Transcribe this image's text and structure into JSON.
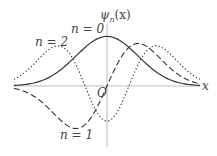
{
  "chart_data": {
    "type": "line",
    "title": "",
    "xlabel": "x",
    "ylabel": "ψn(x)",
    "origin_label": "O",
    "xlim": [
      -3.0,
      3.0
    ],
    "ylim": [
      -0.9,
      1.0
    ],
    "grid": false,
    "legend": "inline labels",
    "series": [
      {
        "name": "n=0",
        "style": "solid",
        "label_text": "n=0",
        "formula": "pi^-0.25 * exp(-x^2/2)"
      },
      {
        "name": "n=1",
        "style": "dashed",
        "label_text": "n=1",
        "formula": "sqrt(2) * pi^-0.25 * x * exp(-x^2/2)"
      },
      {
        "name": "n=2",
        "style": "dotted",
        "label_text": "n=2",
        "formula": "(2x^2-1)/sqrt(2) * pi^-0.25 * exp(-x^2/2)"
      }
    ],
    "x": [
      -3,
      -2.5,
      -2,
      -1.5,
      -1,
      -0.5,
      0,
      0.5,
      1,
      1.5,
      2,
      2.5,
      3
    ],
    "values": {
      "n=0": [
        0.008,
        0.033,
        0.102,
        0.245,
        0.456,
        0.663,
        0.751,
        0.663,
        0.456,
        0.245,
        0.102,
        0.033,
        0.008
      ],
      "n=1": [
        -0.034,
        -0.115,
        -0.288,
        -0.52,
        -0.645,
        -0.469,
        0.0,
        0.469,
        0.645,
        0.52,
        0.288,
        0.115,
        0.034
      ],
      "n=2": [
        0.096,
        0.266,
        0.505,
        0.606,
        0.323,
        -0.234,
        -0.531,
        -0.234,
        0.323,
        0.606,
        0.505,
        0.266,
        0.096
      ]
    }
  },
  "labels": {
    "y_axis": "ψ",
    "y_axis_sub": "n",
    "y_axis_arg": "(x)",
    "x_axis": "x",
    "origin": "O",
    "n0": "n = 0",
    "n1": "n = 1",
    "n2": "n = 2"
  },
  "colors": {
    "curve": "#333333",
    "axis": "#aaaaaa"
  }
}
